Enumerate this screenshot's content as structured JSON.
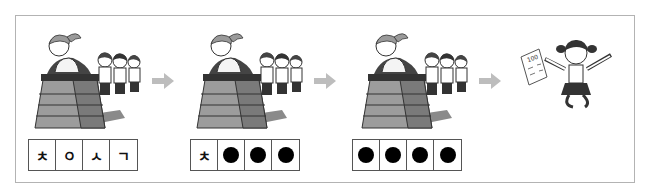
{
  "stages": [
    {
      "scene": "girl-vaulting-with-three-children-waiting",
      "cells": [
        {
          "type": "char",
          "value": "ㅊ"
        },
        {
          "type": "char",
          "value": "ㅇ"
        },
        {
          "type": "char",
          "value": "ㅅ"
        },
        {
          "type": "char",
          "value": "ㄱ"
        }
      ]
    },
    {
      "scene": "girl-vaulting-with-three-children-waiting",
      "cells": [
        {
          "type": "char",
          "value": "ㅊ"
        },
        {
          "type": "dot",
          "value": "●"
        },
        {
          "type": "dot",
          "value": "●"
        },
        {
          "type": "dot",
          "value": "●"
        }
      ]
    },
    {
      "scene": "girl-vaulting-with-three-children-waiting",
      "cells": [
        {
          "type": "dot",
          "value": "●"
        },
        {
          "type": "dot",
          "value": "●"
        },
        {
          "type": "dot",
          "value": "●"
        },
        {
          "type": "dot",
          "value": "●"
        }
      ]
    },
    {
      "scene": "girl-jumping-with-100-score-paper",
      "paper_score": "100"
    }
  ],
  "labels": {
    "s1c1": "ㅊ",
    "s1c2": "ㅇ",
    "s1c3": "ㅅ",
    "s1c4": "ㄱ",
    "s2c1": "ㅊ",
    "score": "100"
  },
  "colors": {
    "frame": "#b3b3b3",
    "arrow": "#bdbdbd",
    "box_dark": "#6a6a6a",
    "box_light": "#a8a8a8",
    "dot": "#000000"
  }
}
